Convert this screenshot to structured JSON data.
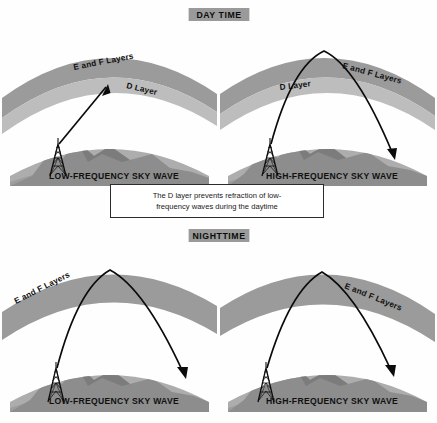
{
  "figure": {
    "background_color": "#fefefe"
  },
  "colors": {
    "ef_layer_band": "#9b9b9b",
    "d_layer_band": "#bdbdbd",
    "ground_fill": "#adadad",
    "ground_shadow": "#8f8f8f",
    "mountain": "#7e7e7e",
    "banner_background": "#9a9a9a",
    "ray_stroke": "#0b0b0b",
    "text": "#111111",
    "caption_border": "#2b2b2b"
  },
  "sections": [
    {
      "id": "daytime",
      "banner_label": "DAY TIME"
    },
    {
      "id": "nighttime",
      "banner_label": "NIGHTTIME"
    }
  ],
  "caption": {
    "line1": "The D layer prevents refraction of low-",
    "line2": "frequency  waves  during  the  daytime",
    "full_text": "The D layer prevents refraction of low-frequency waves during the daytime"
  },
  "panels": [
    {
      "id": "daytime-low-frequency",
      "position": "top-left",
      "section": "daytime",
      "ef_label": "E and F Layers",
      "d_label": "D Layer",
      "ground_label": "LOW-FREQUENCY SKY WAVE",
      "has_d_layer": true,
      "ray_behavior": "absorbed-in-d-layer",
      "ray_description": "Single straight ray from transmitter up into the D layer, arrowhead stops inside the D layer (no return to earth)."
    },
    {
      "id": "daytime-high-frequency",
      "position": "top-right",
      "section": "daytime",
      "ef_label": "E and F Layers",
      "d_label": "D Layer",
      "ground_label": "HIGH-FREQUENCY SKY WAVE",
      "has_d_layer": true,
      "ray_behavior": "refracted-by-ef-layers",
      "ray_description": "Ray passes through the D layer, refracts at the E and F layers and returns to earth with an arrowhead on the ground at right."
    },
    {
      "id": "nighttime-low-frequency",
      "position": "bottom-left",
      "section": "nighttime",
      "ef_label": "E and F Layers",
      "d_label": "",
      "ground_label": "LOW-FREQUENCY SKY WAVE",
      "has_d_layer": false,
      "ray_behavior": "refracted-by-ef-layers",
      "ray_description": "With no D layer at night the low-frequency ray refracts at the E and F layers and returns to earth."
    },
    {
      "id": "nighttime-high-frequency",
      "position": "bottom-right",
      "section": "nighttime",
      "ef_label": "E and F Layers",
      "d_label": "",
      "ground_label": "HIGH-FREQUENCY SKY WAVE",
      "has_d_layer": false,
      "ray_behavior": "refracted-by-ef-layers",
      "ray_description": "High-frequency ray refracts at the E and F layers and returns to earth."
    }
  ]
}
